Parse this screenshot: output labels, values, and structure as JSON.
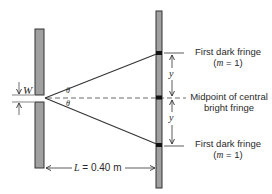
{
  "diagram": {
    "colors": {
      "barrier_fill": "#a0a0a0",
      "stroke": "#333333",
      "text": "#2a2a2a",
      "background": "#ffffff"
    },
    "labels": {
      "top_fringe_line1": "First dark fringe",
      "top_fringe_line2": "(m = 1)",
      "top_fringe_m": "m",
      "top_fringe_eq": " = 1)",
      "center_line1": "Midpoint of central",
      "center_line2": "bright fringe",
      "bottom_fringe_line1": "First dark fringe",
      "bottom_fringe_m": "m",
      "bottom_fringe_eq": " = 1)",
      "slit_width": "W",
      "angle_top": "θ",
      "angle_bottom": "θ",
      "y_top": "y",
      "y_bottom": "y",
      "distance_L": "L",
      "distance_value": " = 0.40 m"
    }
  }
}
